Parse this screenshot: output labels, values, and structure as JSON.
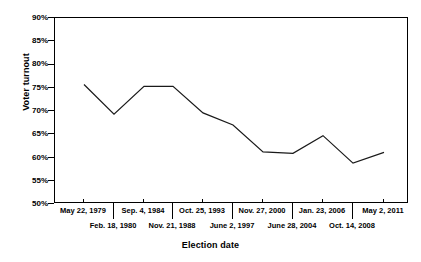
{
  "chart_data": {
    "type": "line",
    "title": "",
    "xlabel": "Election date",
    "ylabel": "Voter turnout",
    "ylim": [
      50,
      90
    ],
    "ytick_labels": [
      "90%",
      "85%",
      "80%",
      "75%",
      "70%",
      "65%",
      "60%",
      "55%",
      "50%"
    ],
    "ytick_values": [
      90,
      85,
      80,
      75,
      70,
      65,
      60,
      55,
      50
    ],
    "grid": false,
    "legend": null,
    "categories": [
      "May 22, 1979",
      "Feb. 18, 1980",
      "Sep. 4, 1984",
      "Nov. 21, 1988",
      "Oct. 25, 1993",
      "June 2, 1997",
      "Nov. 27, 2000",
      "June 28, 2004",
      "Jan. 23, 2006",
      "Oct. 14, 2008",
      "May 2, 2011"
    ],
    "values": [
      75.7,
      69.3,
      75.3,
      75.3,
      69.6,
      67.0,
      61.2,
      60.9,
      64.7,
      58.8,
      61.1
    ],
    "xtick_labels_row1": [
      "May 22, 1979",
      "Sep. 4, 1984",
      "Oct. 25, 1993",
      "Nov. 27, 2000",
      "Jan. 23, 2006",
      "May 2, 2011"
    ],
    "xtick_labels_row2": [
      "Feb. 18, 1980",
      "Nov. 21, 1988",
      "June 2, 1997",
      "June 28, 2004",
      "Oct. 14, 2008"
    ],
    "line_color": "#1a1a1a",
    "axis_color": "#000000",
    "background_color": "#ffffff"
  }
}
